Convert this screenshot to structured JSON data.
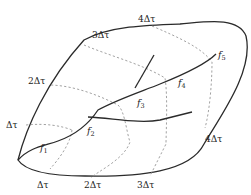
{
  "diagram": {
    "colors": {
      "boundary": "#2a2a2a",
      "contour": "#8a8a8a",
      "background": "#ffffff"
    },
    "contour_labels": {
      "left_1": "Δτ",
      "left_2": "2Δτ",
      "left_3": "3Δτ",
      "top_4": "4Δτ",
      "bottom_1": "Δτ",
      "bottom_2": "2Δτ",
      "bottom_3": "3Δτ",
      "right_4": "4Δτ"
    },
    "faults": [
      {
        "name": "f",
        "sub": "1"
      },
      {
        "name": "f",
        "sub": "2"
      },
      {
        "name": "f",
        "sub": "3"
      },
      {
        "name": "f",
        "sub": "4"
      },
      {
        "name": "f",
        "sub": "5"
      }
    ]
  }
}
